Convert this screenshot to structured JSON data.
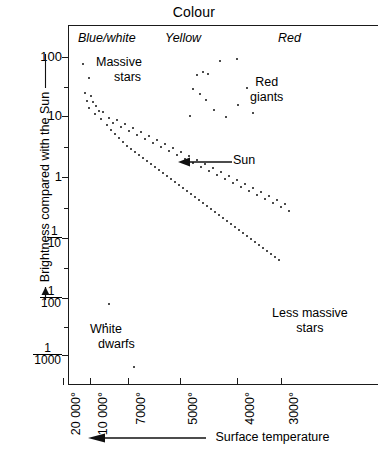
{
  "title": "Colour",
  "axes": {
    "y_title": "Brightness compared with the Sun",
    "x_title": "Surface temperature",
    "y_ticks": [
      {
        "label": "100",
        "type": "plain",
        "y": 57
      },
      {
        "label": "10",
        "type": "plain",
        "y": 116
      },
      {
        "label": "1",
        "type": "plain",
        "y": 177
      },
      {
        "label": "1/10",
        "num": "1",
        "den": "10",
        "type": "frac",
        "y": 238
      },
      {
        "label": "1/100",
        "num": "1",
        "den": "100",
        "type": "frac",
        "y": 298
      },
      {
        "label": "1/1000",
        "num": "1",
        "den": "1000",
        "type": "frac",
        "y": 355
      }
    ],
    "x_ticks": [
      {
        "label": "20 000°",
        "x": 63
      },
      {
        "label": "10 000°",
        "x": 90
      },
      {
        "label": "7000°",
        "x": 128
      },
      {
        "label": "5000°",
        "x": 180
      },
      {
        "label": "4000°",
        "x": 237
      },
      {
        "label": "3000°",
        "x": 281
      }
    ]
  },
  "colour_bands": [
    {
      "name": "blue-white",
      "label": "Blue/white"
    },
    {
      "name": "yellow",
      "label": "Yellow"
    },
    {
      "name": "red",
      "label": "Red"
    }
  ],
  "annotations": {
    "massive_stars": "Massive\nstars",
    "massive_stars_line1": "Massive",
    "massive_stars_line2": "stars",
    "red_giants_line1": "Red",
    "red_giants_line2": "giants",
    "less_massive_line1": "Less massive",
    "less_massive_line2": "stars",
    "white_dwarfs_line1": "White",
    "white_dwarfs_line2": "dwarfs",
    "sun": "Sun"
  },
  "chart_data": {
    "type": "scatter",
    "title": "Colour",
    "subtitle": "Hertzsprung-Russell diagram",
    "xlabel": "Surface temperature",
    "ylabel": "Brightness compared with the Sun",
    "x_axis": {
      "scale": "reversed-temperature",
      "tick_labels": [
        "20 000°",
        "10 000°",
        "7000°",
        "5000°",
        "4000°",
        "3000°"
      ],
      "tick_values": [
        20000,
        10000,
        7000,
        5000,
        4000,
        3000
      ],
      "direction": "decreasing left to right",
      "band_labels": [
        "Blue/white",
        "Yellow",
        "Red"
      ]
    },
    "y_axis": {
      "scale": "log",
      "tick_labels": [
        "100",
        "10",
        "1",
        "1/10",
        "1/100",
        "1/1000"
      ],
      "tick_values": [
        100,
        10,
        1,
        0.1,
        0.01,
        0.001
      ],
      "ylim": [
        0.0004,
        300
      ]
    },
    "grid": false,
    "legend": null,
    "annotations": [
      {
        "text": "Massive stars",
        "region": "upper-left"
      },
      {
        "text": "Red giants",
        "region": "upper-right"
      },
      {
        "text": "Sun",
        "region": "centre",
        "marker": "arrow pointing left"
      },
      {
        "text": "Less massive stars",
        "region": "lower-right"
      },
      {
        "text": "White dwarfs",
        "region": "lower-left"
      }
    ],
    "series": [
      {
        "name": "main-sequence",
        "description": "Diagonal band of stars running from hot/bright upper left to cool/faint lower right",
        "points_px": [
          [
            82,
            63
          ],
          [
            88,
            77
          ],
          [
            84,
            92
          ],
          [
            90,
            95
          ],
          [
            86,
            100
          ],
          [
            92,
            101
          ],
          [
            95,
            105
          ],
          [
            88,
            107
          ],
          [
            98,
            110
          ],
          [
            94,
            113
          ],
          [
            102,
            111
          ],
          [
            100,
            118
          ],
          [
            108,
            117
          ],
          [
            106,
            124
          ],
          [
            112,
            122
          ],
          [
            116,
            119
          ],
          [
            110,
            129
          ],
          [
            120,
            126
          ],
          [
            114,
            133
          ],
          [
            124,
            123
          ],
          [
            118,
            137
          ],
          [
            128,
            130
          ],
          [
            122,
            141
          ],
          [
            132,
            127
          ],
          [
            126,
            145
          ],
          [
            136,
            134
          ],
          [
            130,
            148
          ],
          [
            140,
            131
          ],
          [
            134,
            151
          ],
          [
            144,
            138
          ],
          [
            138,
            154
          ],
          [
            148,
            135
          ],
          [
            142,
            157
          ],
          [
            152,
            142
          ],
          [
            146,
            160
          ],
          [
            156,
            139
          ],
          [
            150,
            163
          ],
          [
            160,
            146
          ],
          [
            154,
            166
          ],
          [
            164,
            143
          ],
          [
            158,
            169
          ],
          [
            168,
            150
          ],
          [
            162,
            172
          ],
          [
            172,
            147
          ],
          [
            166,
            175
          ],
          [
            176,
            154
          ],
          [
            170,
            178
          ],
          [
            180,
            151
          ],
          [
            174,
            181
          ],
          [
            184,
            158
          ],
          [
            178,
            184
          ],
          [
            188,
            155
          ],
          [
            182,
            187
          ],
          [
            192,
            162
          ],
          [
            186,
            190
          ],
          [
            196,
            159
          ],
          [
            190,
            193
          ],
          [
            200,
            166
          ],
          [
            194,
            196
          ],
          [
            204,
            163
          ],
          [
            198,
            199
          ],
          [
            208,
            170
          ],
          [
            202,
            202
          ],
          [
            212,
            167
          ],
          [
            206,
            205
          ],
          [
            216,
            174
          ],
          [
            210,
            208
          ],
          [
            220,
            171
          ],
          [
            214,
            211
          ],
          [
            224,
            178
          ],
          [
            218,
            214
          ],
          [
            228,
            175
          ],
          [
            222,
            217
          ],
          [
            232,
            182
          ],
          [
            226,
            220
          ],
          [
            236,
            179
          ],
          [
            230,
            223
          ],
          [
            240,
            186
          ],
          [
            234,
            226
          ],
          [
            244,
            183
          ],
          [
            238,
            229
          ],
          [
            248,
            190
          ],
          [
            242,
            232
          ],
          [
            252,
            187
          ],
          [
            246,
            235
          ],
          [
            256,
            194
          ],
          [
            250,
            238
          ],
          [
            260,
            191
          ],
          [
            254,
            241
          ],
          [
            264,
            198
          ],
          [
            258,
            244
          ],
          [
            268,
            195
          ],
          [
            262,
            247
          ],
          [
            272,
            202
          ],
          [
            266,
            250
          ],
          [
            276,
            199
          ],
          [
            270,
            253
          ],
          [
            280,
            206
          ],
          [
            274,
            256
          ],
          [
            284,
            203
          ],
          [
            278,
            259
          ],
          [
            288,
            210
          ]
        ]
      },
      {
        "name": "red-giants",
        "description": "Loose scattering of luminous cool stars in upper right",
        "points_px": [
          [
            219,
            60
          ],
          [
            196,
            74
          ],
          [
            202,
            71
          ],
          [
            207,
            73
          ],
          [
            192,
            88
          ],
          [
            199,
            93
          ],
          [
            205,
            99
          ],
          [
            246,
            87
          ],
          [
            237,
            104
          ],
          [
            252,
            112
          ],
          [
            189,
            115
          ],
          [
            225,
            116
          ],
          [
            213,
            109
          ],
          [
            236,
            58
          ]
        ]
      },
      {
        "name": "white-dwarfs",
        "description": "Faint hot stars in the lower left",
        "points_px": [
          [
            108,
            303
          ],
          [
            105,
            323
          ],
          [
            133,
            366
          ]
        ]
      }
    ]
  }
}
